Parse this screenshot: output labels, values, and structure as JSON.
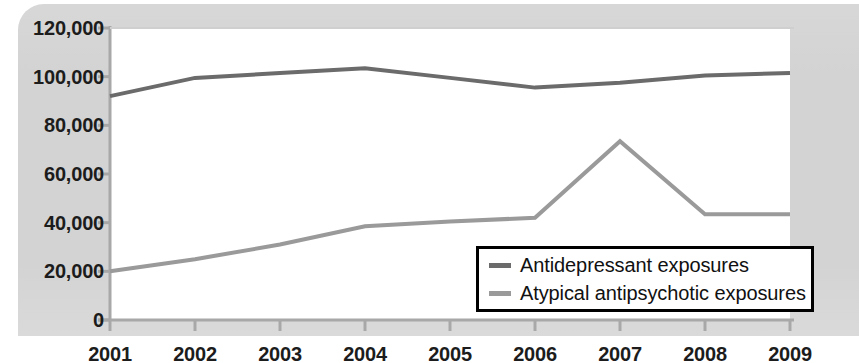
{
  "chart_data": {
    "type": "line",
    "title": "",
    "xlabel": "",
    "ylabel": "",
    "x": [
      2001,
      2002,
      2003,
      2004,
      2005,
      2006,
      2007,
      2008,
      2009
    ],
    "categories": [
      "2001",
      "2002",
      "2003",
      "2004",
      "2005",
      "2006",
      "2007",
      "2008",
      "2009"
    ],
    "series": [
      {
        "name": "Antidepressant exposures",
        "color": "#6b6b6b",
        "values": [
          92000,
          99500,
          101500,
          103500,
          99500,
          95500,
          97500,
          100500,
          101500
        ]
      },
      {
        "name": "Atypical antipsychotic exposures",
        "color": "#9a9a9a",
        "values": [
          20000,
          25000,
          31000,
          38500,
          40500,
          42000,
          73500,
          43500,
          43500
        ]
      }
    ],
    "ylim": [
      0,
      120000
    ],
    "ytick_values": [
      0,
      20000,
      40000,
      60000,
      80000,
      100000,
      120000
    ],
    "ytick_labels": [
      "0",
      "20,000",
      "40,000",
      "60,000",
      "80,000",
      "100,000",
      "120,000"
    ],
    "xtick_labels": [
      "2001",
      "2002",
      "2003",
      "2004",
      "2005",
      "2006",
      "2007",
      "2008",
      "2009"
    ],
    "grid": false,
    "legend_position": "lower-right",
    "legend_entries": [
      {
        "label": "Antidepressant exposures",
        "color": "#6b6b6b"
      },
      {
        "label": "Atypical antipsychotic exposures",
        "color": "#9a9a9a"
      }
    ],
    "colors": {
      "backdrop": "#d3d3d3",
      "plot_background": "#ffffff",
      "axis": "#a8a8a8",
      "legend_border": "#000000",
      "text": "#1c1c1c"
    }
  }
}
